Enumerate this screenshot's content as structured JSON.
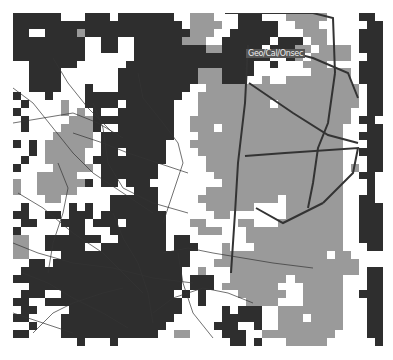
{
  "map": {
    "label": "Geo/Cal/Onsec",
    "colors": {
      "empty": "#ffffff",
      "medium": "#9a9a9a",
      "dense": "#2e2e2e",
      "roads": "#333333",
      "boundary": "#333333"
    },
    "cols": 46,
    "rows": 42,
    "grid": [
      "2222220002220222222200111000222000111110000220",
      "2222222222222222222220111100222220011100000022",
      "2200222212222222222222111002222220001110000222",
      "2222222220022002222221110022222202220110000222",
      "2222222220022002222222221122222022211011110222",
      "2222222220000002222222222222222200210111110022",
      "0022222200000022222222222222220020001110000222",
      "0022220000000222222222211122220000000111110222",
      "0022220000000222222222211122200100111111110222",
      "0022220002000222222222001111111111111111111022",
      "2000200002222222222220011111111111111111111022",
      "0200001002222022222200011111111101111111111022",
      "2000001010200222222200011111111111111111110022",
      "0200000111222222222200111111111111111111110220",
      "0200001111200222222200111011111111111111100022",
      "0000011111022222222200011111111111111111100222",
      "2020111111022222222000111111111111111111100022",
      "0020111110022022222000011111111111111111100222",
      "0200111110222222222000001111111111111111100022",
      "2000011111022222220000001111111111111111101022",
      "0001111100022222220000000111111111111111100220",
      "1001111112022022200000000011111111111111100020",
      "1001111100000002220000001111111111111111100020",
      "0000110000002222220000011111111110111111100220",
      "0200000202002222220000001111110000111111100222",
      "2200220222022222222000000110000000111111100222",
      "0220002220222022222000110000110001111111100222",
      "2000000220002222222000011100011111111111100222",
      "1100222222200222222022000000011111111111100222",
      "1100222220022222222022200010001111111111100022",
      "1100002222222222222222000011111111111110110000",
      "0022022222222222222222000111111111111111111000",
      "0222222222222222222220010001111111111111111022",
      "2222222222222222222220222001111111011111100022",
      "0022222222222222222220222011111110001111100022",
      "0222002222222222222202020000111111001111100222",
      "2200222222222222222220020000011110001111100022",
      "0220000222222222222220000020222001111111100022",
      "2200002222222222222200000022222001110111100022",
      "0020002222222222222000000222002001111111100022",
      "2200002222222222220011000022200111111111000022",
      "0000000020002000000000000002202000111110000002"
    ],
    "roads": [
      "0,75 20,90 40,115 60,140 80,160 110,180 140,200",
      "0,110 30,105 60,100 85,110 110,125",
      "80,90 90,115 95,150 110,175 140,190 175,200",
      "125,60 130,85 150,110 165,130 170,150 160,180 150,210",
      "40,45 55,70 75,95 100,120",
      "5,180 30,195 60,220 90,240 110,260 130,280",
      "0,230 25,240 60,250 100,255 140,265 180,270",
      "20,320 40,300 60,290 90,280 110,275",
      "150,240 175,235 200,240 230,245 260,250 300,255",
      "60,120 90,130 115,140 145,150 175,160",
      "10,260 35,270 60,285 90,300 115,315",
      "140,300 160,285 190,275 215,280 240,290",
      "0,300 30,310 60,320",
      "165,240 170,270 180,300 200,325",
      "100,200 110,225 125,250 135,280 140,310",
      "45,150 55,175 50,200 40,230 35,260"
    ],
    "boundaries": [
      "235,32 232,90 225,150 222,200 218,260",
      "212,0 300,0 320,5 322,60",
      "260,35 300,45 335,60 345,85",
      "236,70 280,100 315,122 345,130",
      "232,143 272,140 345,135 340,160 330,170 310,190",
      "322,60 315,110 305,135 300,170 295,195",
      "243,195 270,210 310,190"
    ]
  }
}
